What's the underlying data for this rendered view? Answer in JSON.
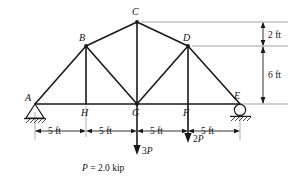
{
  "figure": {
    "type": "truss-free-body-diagram",
    "title": "",
    "nodes": [
      {
        "id": "A",
        "label": "A",
        "x": 35,
        "y": 104,
        "label_x": 25,
        "label_y": 101
      },
      {
        "id": "H",
        "label": "H",
        "x": 86,
        "y": 104,
        "label_x": 81,
        "label_y": 116
      },
      {
        "id": "G",
        "label": "G",
        "x": 137,
        "y": 104,
        "label_x": 132,
        "label_y": 116
      },
      {
        "id": "F",
        "label": "F",
        "x": 188,
        "y": 104,
        "label_x": 183,
        "label_y": 116
      },
      {
        "id": "E",
        "label": "E",
        "x": 240,
        "y": 104,
        "label_x": 234,
        "label_y": 99
      },
      {
        "id": "B",
        "label": "B",
        "x": 86,
        "y": 46,
        "label_x": 79,
        "label_y": 41
      },
      {
        "id": "C",
        "label": "C",
        "x": 137,
        "y": 22,
        "label_x": 132,
        "label_y": 15
      },
      {
        "id": "D",
        "label": "D",
        "x": 188,
        "y": 46,
        "label_x": 183,
        "label_y": 41
      }
    ],
    "members": [
      {
        "name": "bottom-chord-A-E",
        "from": "A",
        "to": "E"
      },
      {
        "name": "top-chord-A-B",
        "from": "A",
        "to": "B"
      },
      {
        "name": "top-chord-B-C",
        "from": "B",
        "to": "C"
      },
      {
        "name": "top-chord-C-D",
        "from": "C",
        "to": "D"
      },
      {
        "name": "top-chord-D-E",
        "from": "D",
        "to": "E"
      },
      {
        "name": "vertical-B-H",
        "from": "B",
        "to": "H"
      },
      {
        "name": "vertical-C-G",
        "from": "C",
        "to": "G"
      },
      {
        "name": "vertical-D-F",
        "from": "D",
        "to": "F"
      },
      {
        "name": "diagonal-B-G",
        "from": "B",
        "to": "G"
      },
      {
        "name": "diagonal-D-G",
        "from": "D",
        "to": "G"
      }
    ],
    "supports": [
      {
        "name": "pin-support-A",
        "kind": "pin",
        "at": "A"
      },
      {
        "name": "roller-support-E",
        "kind": "roller",
        "at": "E"
      }
    ],
    "horizontal_dimensions": [
      {
        "label": "5 ft",
        "from": "A",
        "to": "H"
      },
      {
        "label": "5 ft",
        "from": "H",
        "to": "G"
      },
      {
        "label": "5 ft",
        "from": "G",
        "to": "F"
      },
      {
        "label": "5 ft",
        "from": "F",
        "to": "E"
      }
    ],
    "vertical_dimensions": [
      {
        "label": "2 ft",
        "from_level": "C",
        "to_level": "D"
      },
      {
        "label": "6 ft",
        "from_level": "D",
        "to_level": "base"
      }
    ],
    "loads": [
      {
        "name": "load-at-G",
        "at": "G",
        "magnitude": "3P",
        "coefficient": "3",
        "symbol": "P",
        "direction": "down"
      },
      {
        "name": "load-at-F",
        "at": "F",
        "magnitude": "2P",
        "coefficient": "2",
        "symbol": "P",
        "direction": "down"
      }
    ],
    "caption": {
      "symbol": "P",
      "equals": "=",
      "value": "2.0",
      "unit": "kip",
      "full": "P = 2.0  kip"
    },
    "colors": {
      "member": "#1a1a1a",
      "thin_line": "#6f6f6f",
      "text": "#111111",
      "background": "#ffffff"
    }
  }
}
